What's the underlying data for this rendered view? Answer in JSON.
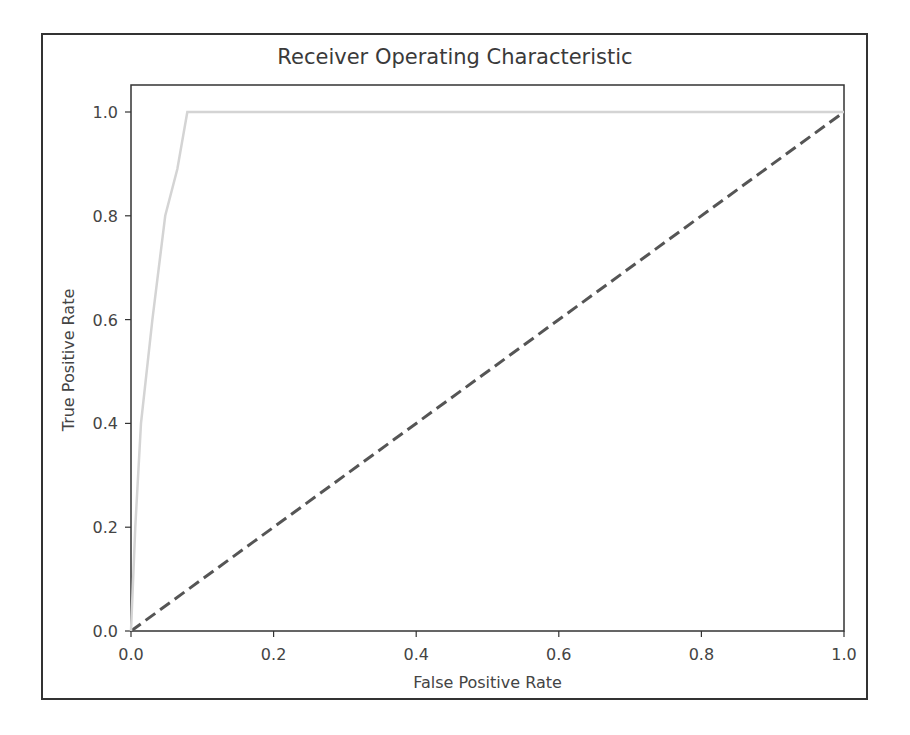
{
  "chart_data": {
    "type": "line",
    "title": "Receiver Operating Characteristic",
    "xlabel": "False Positive Rate",
    "ylabel": "True Positive Rate",
    "xlim": [
      0.0,
      1.0
    ],
    "ylim": [
      0.0,
      1.05
    ],
    "xticks": [
      "0.0",
      "0.2",
      "0.4",
      "0.6",
      "0.8",
      "1.0"
    ],
    "yticks": [
      "0.0",
      "0.2",
      "0.4",
      "0.6",
      "0.8",
      "1.0"
    ],
    "grid": false,
    "legend": null,
    "series": [
      {
        "name": "ROC curve",
        "style": "solid",
        "color": "#d4d4d4",
        "x": [
          0.0,
          0.006,
          0.014,
          0.03,
          0.048,
          0.065,
          0.079,
          1.0
        ],
        "y": [
          0.0,
          0.2,
          0.4,
          0.6,
          0.8,
          0.89,
          1.0,
          1.0
        ]
      },
      {
        "name": "Random classifier",
        "style": "dashed",
        "color": "#555555",
        "x": [
          0.0,
          1.0
        ],
        "y": [
          0.0,
          1.0
        ]
      }
    ]
  }
}
